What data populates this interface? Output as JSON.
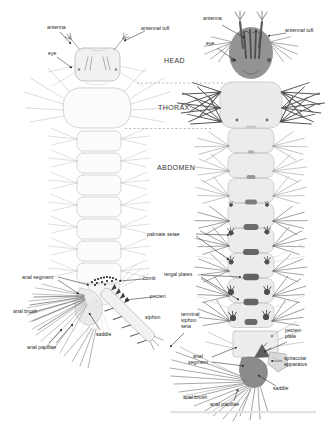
{
  "diagram": {
    "region_labels": {
      "head": "HEAD",
      "thorax": "THORAX",
      "abdomen": "ABDOMEN"
    },
    "left_larva": {
      "antenna": "antenna",
      "antennal_tuft": "antennal tuft",
      "eye": "eye",
      "anal_segment": "anal segment",
      "anal_brush": "anal brush",
      "anal_papillae": "anal papillae",
      "saddle": "saddle",
      "comb": "comb",
      "pecten": "pecten",
      "siphon": "siphon",
      "terminal_siphon_seta": "terminal siphon seta"
    },
    "right_larva": {
      "antenna": "antenna",
      "antennal_tuft": "antennal tuft",
      "eye": "eye",
      "palmate_setae": "palmate setae",
      "tergal_plates": "tergal plates",
      "pecten_plate": "pecten plate",
      "spiracular_apparatus": "spiracular apparatus",
      "saddle": "saddle",
      "anal_segment": "anal segment",
      "anal_brush": "anal brush",
      "anal_papillae": "anal papillae"
    },
    "colors": {
      "background": "#ffffff",
      "label_text": "#1f1f1f",
      "left_larva_outline": "#c6c6c6",
      "right_larva_shade": "#8f8f8f",
      "dark_structures": "#5a5a5a"
    }
  }
}
